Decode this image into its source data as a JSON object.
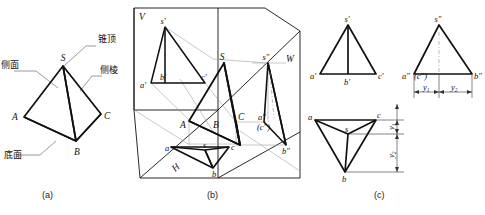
{
  "figure": {
    "captions": {
      "a": "(a)",
      "b": "(b)",
      "c": "(c)"
    },
    "colors": {
      "line": "#111111",
      "thin": "#8c8c8c",
      "background": "#ffffff"
    }
  },
  "panel_a": {
    "name": "三棱锥立体图",
    "annotations": [
      {
        "key": "apex",
        "label": "锥顶"
      },
      {
        "key": "face",
        "label": "侧面"
      },
      {
        "key": "edge",
        "label": "侧棱"
      },
      {
        "key": "base",
        "label": "底面"
      }
    ],
    "vertices": [
      {
        "id": "S",
        "label": "S"
      },
      {
        "id": "A",
        "label": "A"
      },
      {
        "id": "B",
        "label": "B"
      },
      {
        "id": "C",
        "label": "C"
      }
    ]
  },
  "panel_b": {
    "name": "三投影面体系中的三棱锥",
    "planes": [
      {
        "id": "V",
        "label": "V"
      },
      {
        "id": "H",
        "label": "H"
      },
      {
        "id": "W",
        "label": "W"
      }
    ],
    "solid_vertices": [
      {
        "id": "S",
        "label": "S"
      },
      {
        "id": "A",
        "label": "A"
      },
      {
        "id": "B",
        "label": "B"
      },
      {
        "id": "C",
        "label": "C"
      }
    ],
    "v_projection": [
      {
        "id": "s1",
        "label": "s'"
      },
      {
        "id": "a1",
        "label": "a'"
      },
      {
        "id": "b1",
        "label": "b'"
      },
      {
        "id": "c1",
        "label": "c'"
      }
    ],
    "h_projection": [
      {
        "id": "s",
        "label": "s"
      },
      {
        "id": "a",
        "label": "a"
      },
      {
        "id": "b",
        "label": "b"
      },
      {
        "id": "c",
        "label": "c"
      }
    ],
    "w_projection": [
      {
        "id": "s2",
        "label": "s\""
      },
      {
        "id": "a2",
        "label": "a\""
      },
      {
        "id": "c2",
        "label": "(c\")"
      },
      {
        "id": "b2",
        "label": "b\""
      }
    ]
  },
  "panel_c": {
    "name": "三视图",
    "front_view": [
      {
        "id": "s1",
        "label": "s'"
      },
      {
        "id": "a1",
        "label": "a'"
      },
      {
        "id": "b1",
        "label": "b'"
      },
      {
        "id": "c1",
        "label": "c'"
      }
    ],
    "side_view": [
      {
        "id": "s2",
        "label": "s\""
      },
      {
        "id": "a2",
        "label": "a\""
      },
      {
        "id": "c2",
        "label": "(c\")"
      },
      {
        "id": "b2",
        "label": "b\""
      }
    ],
    "top_view": [
      {
        "id": "s",
        "label": "s"
      },
      {
        "id": "a",
        "label": "a"
      },
      {
        "id": "b",
        "label": "b"
      },
      {
        "id": "c",
        "label": "c"
      }
    ],
    "dimensions": [
      {
        "id": "y1_side",
        "label": "y",
        "sub": "1"
      },
      {
        "id": "y2_side",
        "label": "y",
        "sub": "2"
      },
      {
        "id": "y1_top",
        "label": "y",
        "sub": "1"
      },
      {
        "id": "y2_top",
        "label": "y",
        "sub": "2"
      }
    ]
  }
}
